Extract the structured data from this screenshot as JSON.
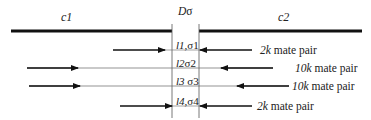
{
  "diagram": {
    "contigs": [
      {
        "name": "c1",
        "x1": 11,
        "x2": 172,
        "y": 31
      },
      {
        "name": "c2",
        "x1": 199,
        "x2": 362,
        "y": 31
      }
    ],
    "gap": {
      "label_main": "D",
      "label_sigma": "σ",
      "left_x": 172,
      "right_x": 199,
      "top_y": 24,
      "bottom_y": 118
    },
    "rows": [
      {
        "y": 50,
        "label_l": "l1",
        "label_sep": ",",
        "label_sigma": "σ1",
        "left_arrow": [
          113,
          165
        ],
        "right_arrow": [
          252,
          200
        ],
        "thin_line": false,
        "mate_size": "2k",
        "mate_text": " mate pair",
        "mate_x": 260
      },
      {
        "y": 68,
        "label_l": "l2",
        "label_sep": "",
        "label_sigma": "σ2",
        "left_arrow": [
          27,
          78
        ],
        "right_arrow": [
          273,
          221
        ],
        "thin_line": true,
        "mate_size": "10k",
        "mate_text": " mate pair",
        "mate_x": 295
      },
      {
        "y": 86,
        "label_l": "l3",
        "label_sep": " ",
        "label_sigma": "σ3",
        "left_arrow": [
          29,
          80
        ],
        "right_arrow": [
          289,
          237
        ],
        "thin_line": true,
        "mate_size": "10k",
        "mate_text": " mate pair",
        "mate_x": 292
      },
      {
        "y": 106,
        "label_l": "l4",
        "label_sep": ",",
        "label_sigma": "σ4",
        "left_arrow": [
          120,
          172
        ],
        "right_arrow": [
          252,
          200
        ],
        "thin_line": false,
        "mate_size": "2k",
        "mate_text": " mate pair",
        "mate_x": 257
      }
    ],
    "colors": {
      "line": "#111111",
      "thin": "#666666",
      "gap_line": "#555555"
    }
  }
}
